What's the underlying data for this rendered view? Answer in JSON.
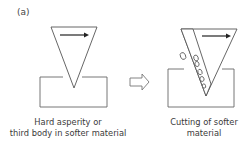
{
  "panel": {
    "label": "(a)"
  },
  "diagram": {
    "left_stage": {
      "name": "hard-asperity-indenting",
      "caption_line1": "Hard asperity or",
      "caption_line2": "third body in softer material",
      "motion": "arrow-right"
    },
    "transition": {
      "icon": "hollow-arrow-right"
    },
    "right_stage": {
      "name": "cutting-softer-material",
      "caption_line1": "Cutting of softer",
      "caption_line2": "material",
      "motion": "arrow-right",
      "debris": "wear-chips"
    },
    "colors": {
      "stroke": "#555555",
      "arrow": "#222222",
      "background": "#ffffff"
    }
  }
}
